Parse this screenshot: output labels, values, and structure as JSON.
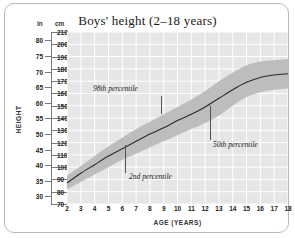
{
  "chart_data": {
    "type": "line",
    "title": "Boys' height (2–18 years)",
    "xlabel": "AGE (YEARS)",
    "ylabel": "HEIGHT",
    "unit_primary": "cm",
    "unit_secondary": "in",
    "unit_head_in": "in",
    "unit_head_cm": "cm",
    "grid": true,
    "legend": "none",
    "xlim": [
      2,
      18
    ],
    "ylim_cm": [
      70,
      210
    ],
    "ylim_in": [
      30,
      80
    ],
    "x_ticks": [
      2,
      3,
      4,
      5,
      6,
      7,
      8,
      9,
      10,
      11,
      12,
      13,
      14,
      15,
      16,
      17,
      18
    ],
    "y_ticks_cm": [
      70,
      80,
      90,
      100,
      110,
      120,
      130,
      140,
      150,
      160,
      170,
      180,
      190,
      200,
      210
    ],
    "y_ticks_in": [
      30,
      35,
      40,
      45,
      50,
      55,
      60,
      65,
      70,
      75,
      80
    ],
    "x": [
      2,
      3,
      4,
      5,
      6,
      7,
      8,
      9,
      10,
      11,
      12,
      13,
      14,
      15,
      16,
      17,
      18
    ],
    "series": [
      {
        "name": "2nd percentile",
        "values": [
          82,
          88,
          94,
          100,
          106,
          111,
          116,
          121,
          126,
          131,
          136,
          142,
          150,
          157,
          161,
          163,
          164
        ]
      },
      {
        "name": "50th percentile",
        "values": [
          87,
          95,
          102,
          109,
          115,
          121,
          127,
          132,
          138,
          143,
          149,
          156,
          163,
          169,
          173,
          175,
          176
        ]
      },
      {
        "name": "98th percentile",
        "values": [
          93,
          101,
          109,
          117,
          124,
          131,
          137,
          143,
          149,
          155,
          162,
          170,
          177,
          183,
          186,
          187,
          188
        ]
      }
    ],
    "annotations": [
      {
        "text": "98th percentile",
        "id": "p98"
      },
      {
        "text": "2nd percentile",
        "id": "p2"
      },
      {
        "text": "50th percentile",
        "id": "p50"
      }
    ],
    "colors": {
      "plot_background": "#e6e6e6",
      "gridline": "#ffffff",
      "band": "#bdbdbd",
      "median_line": "#2b2b2b",
      "card_border": "#b9b9b9"
    }
  }
}
